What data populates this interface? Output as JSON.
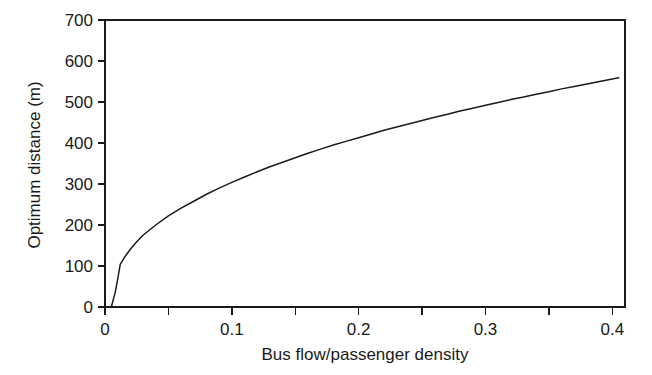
{
  "chart_data": {
    "type": "line",
    "title": "",
    "xlabel": "Bus flow/passenger density",
    "ylabel": "Optimum distance (m)",
    "xlim": [
      0,
      0.41
    ],
    "ylim": [
      0,
      700
    ],
    "grid": false,
    "legend": "none",
    "x_ticks_major": [
      0,
      0.1,
      0.2,
      0.3,
      0.4
    ],
    "x_tick_labels": [
      "0",
      "0.1",
      "0.2",
      "0.3",
      "0.4"
    ],
    "x_ticks_minor": [
      0.05,
      0.15,
      0.25,
      0.35
    ],
    "y_ticks_major": [
      0,
      100,
      200,
      300,
      400,
      500,
      600,
      700
    ],
    "y_tick_labels": [
      "0",
      "100",
      "200",
      "300",
      "400",
      "500",
      "600",
      "700"
    ],
    "series": [
      {
        "name": "Optimum distance",
        "color": "#1a1a1a",
        "x": [
          0.005,
          0.008,
          0.01,
          0.012,
          0.016,
          0.02,
          0.025,
          0.03,
          0.04,
          0.05,
          0.06,
          0.07,
          0.08,
          0.09,
          0.1,
          0.11,
          0.12,
          0.13,
          0.14,
          0.15,
          0.16,
          0.17,
          0.18,
          0.19,
          0.2,
          0.21,
          0.22,
          0.23,
          0.24,
          0.25,
          0.26,
          0.27,
          0.28,
          0.29,
          0.3,
          0.31,
          0.32,
          0.33,
          0.34,
          0.35,
          0.36,
          0.37,
          0.38,
          0.39,
          0.4,
          0.405
        ],
        "y": [
          0,
          35,
          68,
          104,
          124,
          141,
          159,
          175,
          200,
          222,
          241,
          258,
          275,
          290,
          304,
          317,
          330,
          342,
          353,
          364,
          375,
          385,
          395,
          404,
          413,
          422,
          431,
          439,
          447,
          455,
          463,
          470,
          478,
          485,
          492,
          499,
          506,
          512,
          519,
          525,
          532,
          538,
          544,
          550,
          556,
          559
        ]
      }
    ],
    "annotations": []
  },
  "axes": {
    "y_title": "Optimum distance (m)",
    "x_title": "Bus flow/passenger density"
  },
  "colors": {
    "line": "#1a1a1a",
    "axis": "#1a1a1a",
    "background": "#ffffff"
  }
}
